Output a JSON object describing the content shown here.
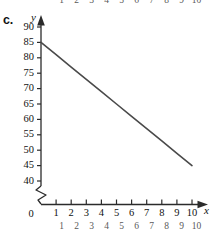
{
  "part_label": "c.",
  "neighbor_top_row": [
    "1",
    "2",
    "3",
    "4",
    "5",
    "6",
    "7",
    "8",
    "9",
    "10"
  ],
  "neighbor_bottom_row": [
    "1",
    "2",
    "3",
    "4",
    "5",
    "6",
    "7",
    "8",
    "9",
    "10"
  ],
  "neighbor_bottom_text": "",
  "axis": {
    "y_name": "y",
    "x_name": "x",
    "origin_label": "0"
  },
  "chart_data": {
    "type": "line",
    "title": "",
    "subtitle": "",
    "xlabel": "x",
    "ylabel": "y",
    "xlim": [
      0,
      10
    ],
    "ylim": [
      40,
      90
    ],
    "y_axis_break": true,
    "y_break_between": [
      0,
      40
    ],
    "grid": false,
    "legend": false,
    "legend_position": "none",
    "x_ticks": [
      0,
      1,
      2,
      3,
      4,
      5,
      6,
      7,
      8,
      9,
      10
    ],
    "x_tick_labels": [
      "0",
      "1",
      "2",
      "3",
      "4",
      "5",
      "6",
      "7",
      "8",
      "9",
      "10"
    ],
    "y_ticks": [
      40,
      45,
      50,
      55,
      60,
      65,
      70,
      75,
      80,
      85,
      90
    ],
    "y_tick_labels": [
      "40",
      "45",
      "50",
      "55",
      "60",
      "65",
      "70",
      "75",
      "80",
      "85",
      "90"
    ],
    "series": [
      {
        "name": "line",
        "color": "#4a4a4a",
        "x": [
          0,
          1,
          2,
          3,
          4,
          5,
          6,
          7,
          8,
          9,
          10
        ],
        "values": [
          85,
          81,
          77,
          73,
          69,
          65,
          61,
          57,
          53,
          49,
          45
        ],
        "endpoints": [
          [
            0,
            85
          ],
          [
            10,
            45
          ]
        ],
        "slope": -4,
        "intercept": 85
      }
    ],
    "colors": {
      "line": "#4a4a4a",
      "axis": "#2b2b2b",
      "text": "#111111",
      "background": "#ffffff"
    }
  }
}
